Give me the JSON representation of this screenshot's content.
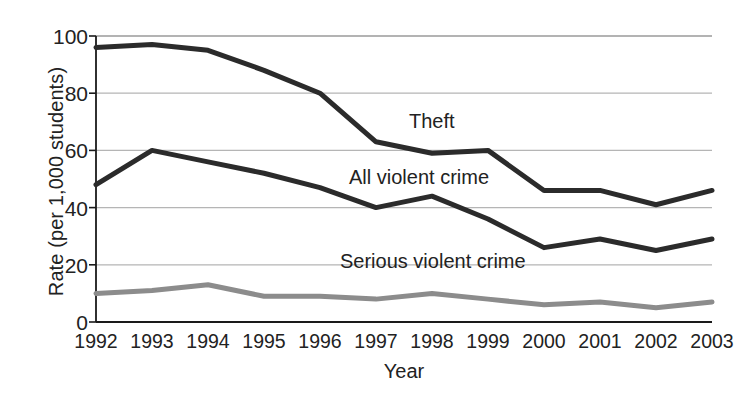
{
  "chart_data": {
    "type": "line",
    "title": "",
    "xlabel": "Year",
    "ylabel": "Rate (per 1,000 students)",
    "categories": [
      "1992",
      "1993",
      "1994",
      "1995",
      "1996",
      "1997",
      "1998",
      "1999",
      "2000",
      "2001",
      "2002",
      "2003"
    ],
    "x": [
      1992,
      1993,
      1994,
      1995,
      1996,
      1997,
      1998,
      1999,
      2000,
      2001,
      2002,
      2003
    ],
    "xlim": [
      1992,
      2003
    ],
    "ylim": [
      0,
      100
    ],
    "yticks": [
      "0",
      "20",
      "40",
      "60",
      "80",
      "100"
    ],
    "ytick_values": [
      0,
      20,
      40,
      60,
      80,
      100
    ],
    "grid": "horizontal",
    "legend_position": "inline-labels",
    "series": [
      {
        "name": "Theft",
        "color": "#2b2b2b",
        "width": 5,
        "values": [
          96,
          97,
          95,
          88,
          80,
          63,
          59,
          60,
          46,
          46,
          41,
          46
        ]
      },
      {
        "name": "All violent crime",
        "color": "#2b2b2b",
        "width": 5,
        "values": [
          48,
          60,
          56,
          52,
          47,
          40,
          44,
          36,
          26,
          29,
          25,
          29
        ]
      },
      {
        "name": "Serious violent crime",
        "color": "#8c8c8c",
        "width": 5,
        "values": [
          10,
          11,
          13,
          9,
          9,
          8,
          10,
          8,
          6,
          7,
          5,
          7
        ]
      }
    ],
    "annotations": [
      {
        "text": "Theft",
        "x": 1998.0,
        "y": 71
      },
      {
        "text": "All violent crime",
        "x": 1997.6,
        "y": 51
      },
      {
        "text": "Serious violent crime",
        "x": 1998.2,
        "y": 20
      }
    ]
  },
  "colors": {
    "axis": "#1a1a1a",
    "grid": "#b5b5b5",
    "text": "#222222",
    "theft_line": "#2b2b2b",
    "all_violent_line": "#2b2b2b",
    "serious_violent_line": "#8c8c8c",
    "background": "#ffffff"
  }
}
